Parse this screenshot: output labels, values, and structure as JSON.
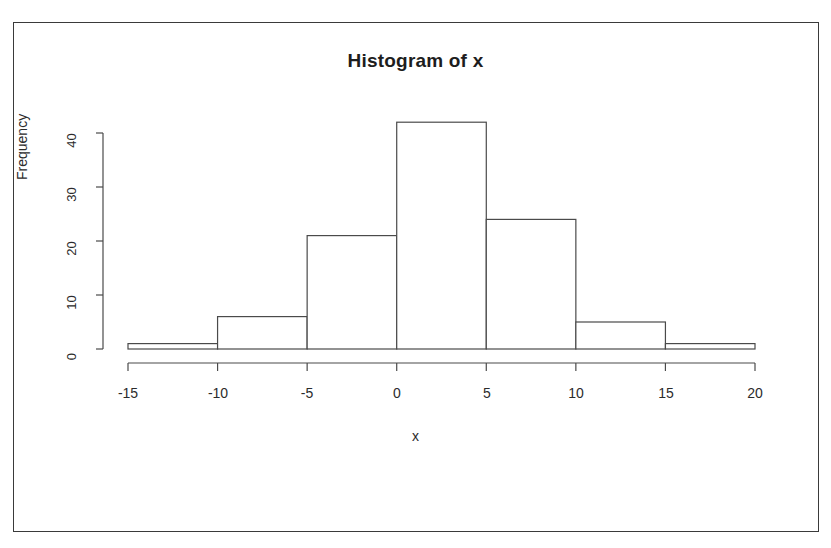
{
  "chart_data": {
    "type": "bar",
    "title": "Histogram of x",
    "xlabel": "x",
    "ylabel": "Frequency",
    "bin_edges": [
      -15,
      -10,
      -5,
      0,
      5,
      10,
      15,
      20
    ],
    "categories": [
      "[-15,-10)",
      "[-10,-5)",
      "[-5,0)",
      "[0,5)",
      "[5,10)",
      "[10,15)",
      "[15,20)"
    ],
    "values": [
      1,
      6,
      21,
      42,
      24,
      5,
      1
    ],
    "bin_width": 5,
    "xlim": [
      -15,
      20
    ],
    "ylim": [
      0,
      42
    ],
    "xticks": [
      -15,
      -10,
      -5,
      0,
      5,
      10,
      15,
      20
    ],
    "xtick_labels": [
      "-15",
      "-10",
      "-5",
      "0",
      "5",
      "10",
      "15",
      "20"
    ],
    "yticks": [
      0,
      10,
      20,
      30,
      40
    ],
    "ytick_labels": [
      "0",
      "10",
      "20",
      "30",
      "40"
    ],
    "grid": false,
    "legend": null,
    "bar_fill": "#ffffff",
    "bar_stroke": "#4a4a4a",
    "axis_color": "#4a4a4a",
    "text_color": "#2b2b2b",
    "background": "#ffffff",
    "frame_border_color": "#3a3a3a"
  }
}
